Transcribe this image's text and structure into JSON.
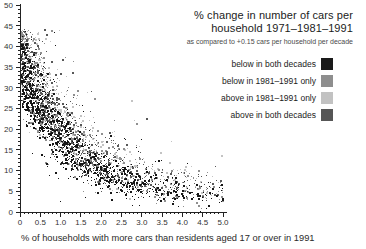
{
  "header": {
    "title_line1": "% change in number of cars per",
    "title_line2": "household 1971–1981–1991",
    "subtitle": "as compared to +0.15 cars per household per decade"
  },
  "legend": {
    "items": [
      {
        "label": "below in both decades",
        "color": "#1a1a1a",
        "key": "black"
      },
      {
        "label": "below in 1981–1991 only",
        "color": "#8e8e8e",
        "key": "mid"
      },
      {
        "label": "above in 1981–1991 only",
        "color": "#c2c2c2",
        "key": "light"
      },
      {
        "label": "above in both decades",
        "color": "#565656",
        "key": "dark"
      }
    ]
  },
  "chart_data": {
    "type": "scatter",
    "title": "% change in number of cars per household 1971–1981–1991",
    "subtitle": "as compared to +0.15 cars per household per decade",
    "xlabel": "% of households with more cars than residents aged 17 or over in 1991",
    "ylabel": "% change in number of cars per household",
    "xlim": [
      0,
      5
    ],
    "ylim": [
      0,
      50
    ],
    "x_tick_labels": [
      "0",
      "0.5",
      "1.0",
      "1.5",
      "2.0",
      "2.5",
      "3.0",
      "3.5",
      "4.0",
      "4.5",
      "5.0"
    ],
    "y_tick_labels": [
      "0",
      "5",
      "10",
      "15",
      "20",
      "25",
      "30",
      "35",
      "40",
      "45",
      "50"
    ],
    "x_tick_step": 0.5,
    "y_tick_step": 5,
    "x_minor_step": 0.1,
    "y_minor_step": 1,
    "grid": false,
    "legend_position": "upper-right",
    "series_note": "dense cloud of ~3000 small square markers; dark ridge follows y ≈ 4 + 33·exp(−x/1.3), black 'below in both decades' points form the core, light-gray 'above' points form a diffuse halo above the ridge, sparse tail to x=5",
    "generator": {
      "seed": 7,
      "count": 3000,
      "x_mean": 1.35,
      "uniform_frac": 0.18,
      "base": 4,
      "amp": 33,
      "decay": 1.3,
      "sd_decay": 2.2,
      "sd_above": [
        5.5,
        1.6
      ],
      "sd_below": [
        3.8,
        1.2
      ],
      "halo_frac": 0.06,
      "big_frac": 0.32,
      "band_hi": 0.8,
      "band_lo": -0.5,
      "color_mix": {
        "above": {
          "light": 0.45,
          "dark": 0.25,
          "mid": 0.2,
          "black": 0.1
        },
        "mid": {
          "black": 0.4,
          "mid": 0.25,
          "dark": 0.2,
          "light": 0.15
        },
        "below": {
          "black": 0.6,
          "mid": 0.25,
          "dark": 0.1,
          "light": 0.05
        }
      }
    }
  },
  "colors": {
    "black": "#161616",
    "dark": "#575757",
    "mid": "#8f8f8f",
    "light": "#c3c3c3",
    "axis": "#222222",
    "tick_text": "#333333"
  }
}
